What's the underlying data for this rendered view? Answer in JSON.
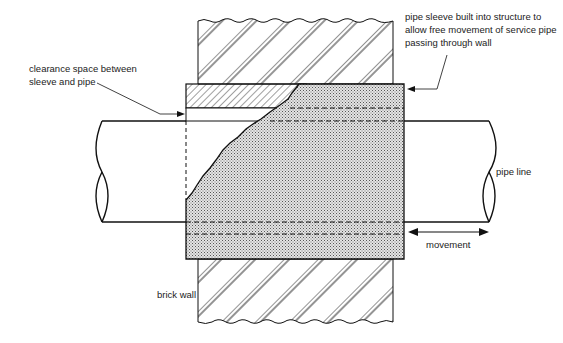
{
  "diagram": {
    "labels": {
      "clearance": [
        "clearance space between",
        "sleeve and pipe"
      ],
      "sleeve": [
        "pipe sleeve built into structure to",
        "allow free movement of service pipe",
        "passing through wall"
      ],
      "pipe_line": "pipe line",
      "movement": "movement",
      "brick_wall": "brick wall"
    },
    "colors": {
      "line": "#111111",
      "sleeve_fill": "#c8c8c8",
      "background": "#ffffff"
    }
  }
}
